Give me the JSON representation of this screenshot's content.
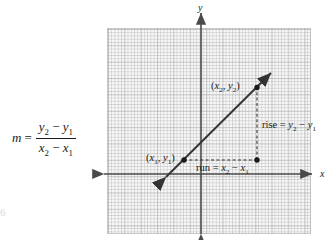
{
  "figure": {
    "type": "coordinate-plane-slope-diagram",
    "axes": {
      "x_label": "x",
      "y_label": "y"
    },
    "points": [
      {
        "id": "p1",
        "label_paren_open": "(",
        "x_var": "x",
        "x_sub": "1",
        "comma": ", ",
        "y_var": "y",
        "y_sub": "1",
        "label_paren_close": ")",
        "label_text": "(x1, y1)"
      },
      {
        "id": "p2",
        "label_paren_open": "(",
        "x_var": "x",
        "x_sub": "2",
        "comma": ", ",
        "y_var": "y",
        "y_sub": "2",
        "label_paren_close": ")",
        "label_text": "(x2, y2)"
      }
    ],
    "annotations": {
      "rise": {
        "word": "rise",
        "equals": " = ",
        "a_var": "y",
        "a_sub": "2",
        "minus": " − ",
        "b_var": "y",
        "b_sub": "1",
        "text": "rise = y2 − y1"
      },
      "run": {
        "word": "run",
        "equals": " = ",
        "a_var": "x",
        "a_sub": "2",
        "minus": " − ",
        "b_var": "x",
        "b_sub": "1",
        "text": "run = x2 − x1"
      }
    },
    "formula": {
      "lhs": "m",
      "equals": "=",
      "numerator": {
        "a_var": "y",
        "a_sub": "2",
        "minus": " − ",
        "b_var": "y",
        "b_sub": "1"
      },
      "denominator": {
        "a_var": "x",
        "a_sub": "2",
        "minus": " − ",
        "b_var": "x",
        "b_sub": "1"
      },
      "text": "m = (y2 − y1) / (x2 − x1)"
    },
    "page_artifact": "6",
    "colors": {
      "ink": "#1a1a1a",
      "grid_background": "#f7f7f7",
      "grid_minor": "#b9b9b9",
      "grid_major": "#969696",
      "axis": "#4a4a4a",
      "line": "#3a3a3a",
      "dashed": "#3a3a3a"
    }
  }
}
